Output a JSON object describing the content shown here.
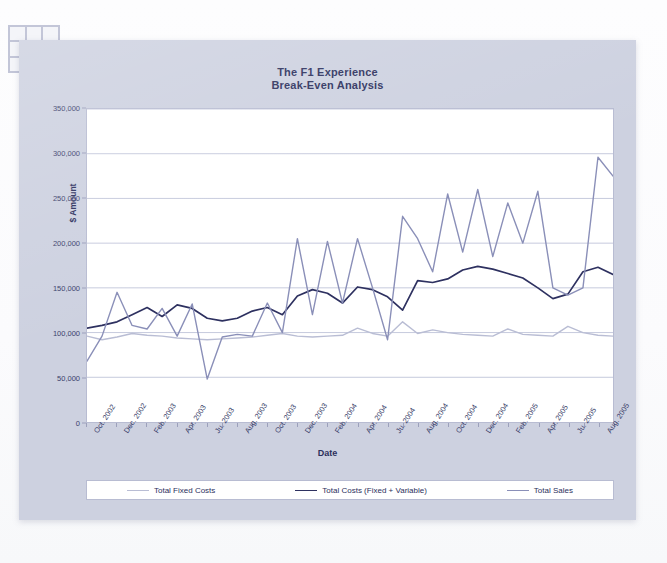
{
  "decor": {
    "corner_grid_icon": "grid-3x3-icon",
    "cells": 9
  },
  "chart_data": {
    "type": "line",
    "title": "The F1 Experience",
    "subtitle": "Break-Even Analysis",
    "xlabel": "Date",
    "ylabel": "$ Amount",
    "ylim": [
      0,
      350000
    ],
    "ytick_values": [
      0,
      50000,
      100000,
      150000,
      200000,
      250000,
      300000,
      350000
    ],
    "ytick_labels": [
      "0",
      "50,000",
      "100,000",
      "150,000",
      "200,000",
      "250,000",
      "300,000",
      "350,000"
    ],
    "grid": true,
    "legend_position": "bottom",
    "x": [
      "Oct. 2002",
      "Nov. 2002",
      "Dec. 2002",
      "Jan. 2003",
      "Feb. 2003",
      "Mar. 2003",
      "Apr. 2003",
      "May 2003",
      "Ju. 2003",
      "Jul. 2003",
      "Aug. 2003",
      "Sep. 2003",
      "Oct. 2003",
      "Nov. 2003",
      "Dec. 2003",
      "Jan. 2004",
      "Feb. 2004",
      "Mar. 2004",
      "Apr. 2004",
      "May 2004",
      "Ju. 2004",
      "Jul. 2004",
      "Aug. 2004",
      "Sep. 2004",
      "Oct. 2004",
      "Nov. 2004",
      "Dec. 2004",
      "Jan. 2005",
      "Feb. 2005",
      "Mar. 2005",
      "Apr. 2005",
      "May 2005",
      "Ju. 2005",
      "Jul. 2005",
      "Aug. 2005",
      "Sep. 2005"
    ],
    "xtick_labels": [
      "Oct. 2002",
      "Dec. 2002",
      "Feb. 2003",
      "Apr. 2003",
      "Ju. 2003",
      "Aug. 2003",
      "Oct. 2003",
      "Dec. 2003",
      "Feb. 2004",
      "Apr. 2004",
      "Ju. 2004",
      "Aug. 2004",
      "Oct. 2004",
      "Dec. 2004",
      "Feb. 2005",
      "Apr. 2005",
      "Ju. 2005",
      "Aug. 2005"
    ],
    "xtick_every": 2,
    "series": [
      {
        "name": "Total Fixed Costs",
        "color": "#b9bdd4",
        "width": 1.4,
        "values": [
          96000,
          92000,
          95000,
          99000,
          97000,
          96000,
          94000,
          93000,
          92000,
          93000,
          94000,
          95000,
          97000,
          99000,
          96000,
          95000,
          96000,
          97000,
          105000,
          99000,
          96000,
          112000,
          99000,
          103000,
          100000,
          98000,
          97000,
          96000,
          104000,
          98000,
          97000,
          96000,
          107000,
          100000,
          97000,
          96000
        ]
      },
      {
        "name": "Total Costs (Fixed + Variable)",
        "color": "#2e3160",
        "width": 1.7,
        "values": [
          105000,
          108000,
          112000,
          120000,
          128000,
          118000,
          131000,
          127000,
          116000,
          113000,
          116000,
          124000,
          128000,
          120000,
          141000,
          148000,
          144000,
          133000,
          151000,
          148000,
          140000,
          125000,
          158000,
          156000,
          160000,
          170000,
          174000,
          171000,
          166000,
          161000,
          150000,
          138000,
          143000,
          168000,
          173000,
          165000
        ]
      },
      {
        "name": "Total Sales",
        "color": "#8a8fb8",
        "width": 1.4,
        "values": [
          68000,
          96000,
          145000,
          108000,
          104000,
          127000,
          96000,
          132000,
          48000,
          95000,
          98000,
          96000,
          133000,
          100000,
          205000,
          120000,
          202000,
          133000,
          205000,
          150000,
          92000,
          230000,
          205000,
          168000,
          255000,
          190000,
          260000,
          185000,
          245000,
          200000,
          258000,
          150000,
          142000,
          150000,
          296000,
          275000
        ]
      }
    ]
  },
  "legend": {
    "items": [
      {
        "label": "Total Fixed Costs",
        "color": "#b9bdd4"
      },
      {
        "label": "Total Costs (Fixed + Variable)",
        "color": "#2e3160"
      },
      {
        "label": "Total Sales",
        "color": "#8a8fb8"
      }
    ]
  }
}
